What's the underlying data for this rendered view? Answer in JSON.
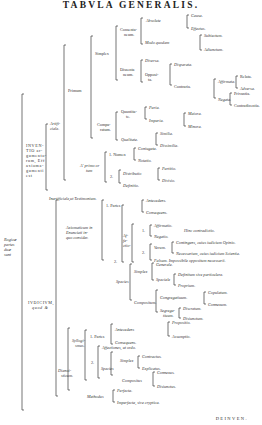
{
  "title": "TABVLA GENERALIS.",
  "footer": "DEINVEN.",
  "root": {
    "label_lines": [
      "Rogicæ",
      "partes",
      "duæ",
      "sunt"
    ]
  },
  "inventio": {
    "label_lines": [
      "INVEN-",
      "TIO ar-",
      "gumento-",
      "rum, Eff",
      "axioma-",
      "gumenti",
      "est"
    ]
  },
  "iudicium": {
    "label_lines": [
      "IVDICIVM,",
      "quod &"
    ]
  },
  "artificiale": {
    "label_lines": [
      "Artifi-",
      "ciale."
    ]
  },
  "inartificiale": "Inartificiale,ut Testimonium.",
  "primum": "Primum",
  "a_primo": {
    "label_lines": [
      "A' primo or",
      "tum"
    ]
  },
  "simplex": "Simplex",
  "consentaneum": {
    "label_lines": [
      "Consenta-",
      "neum."
    ]
  },
  "absolute": "Absolute",
  "causa": "Causa.",
  "effectus": "Effectus.",
  "modo_quodam": "Modo quodam",
  "subiectum": "Subiectum.",
  "adiunctum": "Adiunctum.",
  "dissentaneum": {
    "label_lines": [
      "Dissenta",
      "neum."
    ]
  },
  "diversa": "Diversa.",
  "opposita": {
    "label_lines": [
      "Opposi-",
      "ta."
    ]
  },
  "disparata": "Disparata.",
  "contraria": "Contraria.",
  "affirmata": "Affirmata.",
  "relata": "Relata.",
  "adversa": "Adversa.",
  "negata": "Negata.",
  "privantia": "Privantia.",
  "contradicentia": "Contradicentia.",
  "comparatum": {
    "label_lines": [
      "Compa-",
      "ratum."
    ]
  },
  "quanti": {
    "label_lines": [
      "Quantita-",
      "te."
    ]
  },
  "paria": "Paria.",
  "imparia": "Imparia.",
  "maiora": "Maiora.",
  "minora": "Minora.",
  "qualitate": "Qualitate.",
  "similia": "Similia.",
  "dissimilia": "Dissimilia.",
  "nomen": "1. Nomen",
  "coniugata": "Coniugata.",
  "notatio": "Notatio.",
  "two": "2.",
  "distributio": "Distributio",
  "partitio": "Partitio.",
  "divisio": "Divisio.",
  "definitio": "Definitio.",
  "axioma": {
    "label_lines": [
      "Axiomaticum in",
      "Enunciati in-",
      "quo consider."
    ]
  },
  "partes1": "1. Partes",
  "antecedens1": "Antecedens.",
  "consequens1": "Consequens.",
  "affectio": {
    "label_lines": [
      "Af-",
      "fe-",
      "ctio-",
      "nes."
    ]
  },
  "one": "1.",
  "affirmatio": "Affirmatio.",
  "negatio": "Negatio.",
  "hinc": "Hinc contradictio.",
  "verum": "Verum.",
  "contingens": "Contingens, cuius iudicium Opinio.",
  "necessarium": "Necessarium, cuius iudicium Scientia.",
  "falsum": "Falsum. Impossibile oppositum necessarii.",
  "species": "Species",
  "simplex2": "Simplex",
  "generale": "Generale.",
  "speciale": "Speciale",
  "definitum": "Definitum sive particulare.",
  "proprium": "Proprium.",
  "compositum": "Compositum.",
  "congregatiuum": "Congregatiuum.",
  "copulatum": "Copulatum.",
  "connexum": "Connexum.",
  "segregatiuum": {
    "label_lines": [
      "Segrega-",
      "tiuum."
    ]
  },
  "discretum": "Discretum.",
  "disiunctum": "Disiunctum.",
  "dianoia": {
    "label_lines": [
      "Dianoi-",
      "sticum."
    ]
  },
  "syllogismus": {
    "label_lines": [
      "Syllogi-",
      "smus."
    ]
  },
  "partes2": "1. Partes",
  "antecedens2": "Antecedens",
  "propositio": "Propositio.",
  "assumptio": "Assumptio.",
  "consequens2": "Consequens.",
  "affectiones": "Affectiones, ut ordo.",
  "two2": "2.",
  "species2": "Species",
  "simplex3": "Simplex",
  "contractus": "Contractus.",
  "explicatus": "Explicatus.",
  "compositus": "Compositus",
  "connexus": "Connexus.",
  "disiunctus": "Disiunctus.",
  "methodus": "Methodus",
  "perfecta": "Perfecta.",
  "imperfecta": "Imperfecta, sive cryptica."
}
